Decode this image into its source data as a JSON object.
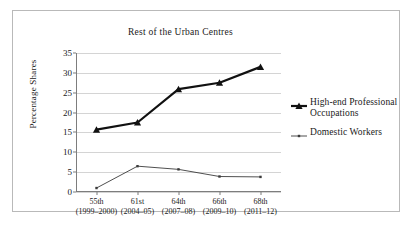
{
  "chart_data": {
    "type": "line",
    "title": "Rest of the Urban Centres",
    "xlabel": "",
    "ylabel": "Percentage Shares",
    "ylim": [
      0,
      35
    ],
    "ytick_step": 5,
    "yticks": [
      "0",
      "5",
      "10",
      "15",
      "20",
      "25",
      "30",
      "35"
    ],
    "grid": true,
    "legend_position": "right",
    "categories": [
      "55th\n(1999–2000)",
      "61st\n(2004–05)",
      "64th\n(2007–08)",
      "66th\n(2009–10)",
      "68th\n(2011–12)"
    ],
    "category_lines": [
      {
        "round": "55th",
        "period": "(1999–2000)"
      },
      {
        "round": "61st",
        "period": "(2004–05)"
      },
      {
        "round": "64th",
        "period": "(2007–08)"
      },
      {
        "round": "66th",
        "period": "(2009–10)"
      },
      {
        "round": "68th",
        "period": "(2011–12)"
      }
    ],
    "series": [
      {
        "name": "High-end Professional Occupations",
        "values": [
          15.7,
          17.5,
          25.9,
          27.5,
          31.5
        ],
        "color": "#111111",
        "marker": "triangle",
        "line_width": 2.2
      },
      {
        "name": "Domestic Workers",
        "values": [
          1.0,
          6.5,
          5.7,
          3.9,
          3.8
        ],
        "color": "#3b3b3b",
        "marker": "square",
        "line_width": 0.9
      }
    ]
  },
  "legend": {
    "items": [
      {
        "label_line1": "High-end Professional",
        "label_line2": "Occupations"
      },
      {
        "label_line1": "Domestic Workers",
        "label_line2": ""
      }
    ]
  }
}
